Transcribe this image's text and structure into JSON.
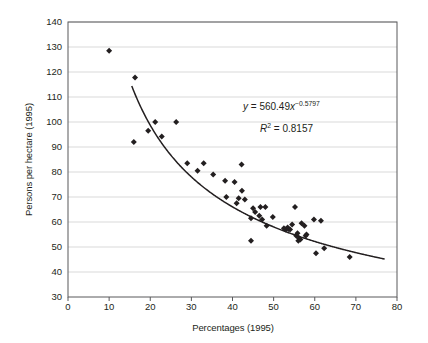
{
  "chart_data": {
    "type": "scatter",
    "title": "",
    "xlabel": "Percentages (1995)",
    "ylabel": "Persons per hectare (1995)",
    "xlim": [
      0,
      80
    ],
    "ylim": [
      30,
      140
    ],
    "xticks": [
      0,
      10,
      20,
      30,
      40,
      50,
      60,
      70,
      80
    ],
    "yticks": [
      30,
      40,
      50,
      60,
      70,
      80,
      90,
      100,
      110,
      120,
      130,
      140
    ],
    "grid": "horizontal",
    "legend": "none",
    "marker": "diamond",
    "marker_color": "#231f20",
    "points": [
      [
        10.0,
        128.5
      ],
      [
        16.3,
        117.8
      ],
      [
        16.0,
        92.0
      ],
      [
        19.5,
        96.5
      ],
      [
        21.2,
        100.0
      ],
      [
        22.8,
        94.2
      ],
      [
        26.3,
        100.0
      ],
      [
        29.0,
        83.5
      ],
      [
        31.5,
        80.5
      ],
      [
        33.0,
        83.5
      ],
      [
        35.3,
        79.0
      ],
      [
        38.2,
        76.5
      ],
      [
        38.5,
        70.0
      ],
      [
        40.5,
        76.0
      ],
      [
        41.5,
        69.5
      ],
      [
        42.2,
        83.0
      ],
      [
        42.3,
        72.5
      ],
      [
        43.0,
        69.0
      ],
      [
        41.0,
        67.5
      ],
      [
        44.5,
        61.5
      ],
      [
        45.0,
        65.5
      ],
      [
        45.5,
        64.0
      ],
      [
        46.5,
        62.5
      ],
      [
        46.8,
        66.0
      ],
      [
        47.2,
        61.0
      ],
      [
        48.0,
        66.0
      ],
      [
        48.3,
        58.5
      ],
      [
        49.8,
        62.0
      ],
      [
        52.5,
        57.5
      ],
      [
        52.9,
        57.0
      ],
      [
        53.4,
        57.8
      ],
      [
        53.6,
        57.2
      ],
      [
        54.0,
        57.0
      ],
      [
        54.5,
        59.0
      ],
      [
        55.2,
        66.0
      ],
      [
        55.5,
        54.5
      ],
      [
        55.8,
        55.5
      ],
      [
        56.0,
        52.5
      ],
      [
        56.2,
        53.5
      ],
      [
        56.5,
        53.0
      ],
      [
        56.8,
        59.5
      ],
      [
        57.5,
        58.5
      ],
      [
        57.8,
        54.5
      ],
      [
        58.0,
        55.0
      ],
      [
        59.8,
        61.0
      ],
      [
        60.3,
        47.5
      ],
      [
        61.5,
        60.5
      ],
      [
        62.3,
        49.5
      ],
      [
        44.5,
        52.5
      ],
      [
        68.5,
        46.0
      ]
    ],
    "trendline": {
      "type": "power",
      "equation": "y = 560.49x^-0.5797",
      "coefficient": 560.49,
      "exponent": -0.5797,
      "r_squared": 0.8157,
      "x_start": 15.5,
      "x_end": 77.0
    },
    "annotations": {
      "equation": {
        "y_symbol": "y",
        "equals": "=",
        "value": "560.49",
        "x_symbol": "x",
        "exponent": "−0.5797"
      },
      "r_squared": {
        "r_symbol": "R",
        "power": "2",
        "equals": "=",
        "value": "0.8157"
      }
    }
  }
}
